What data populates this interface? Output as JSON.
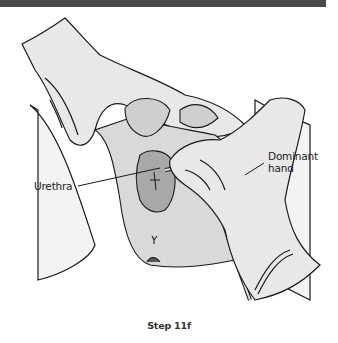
{
  "figure": {
    "header_bar_color": "#4a4a4a",
    "labels": {
      "urethra": "Urethra",
      "dominant_hand_line1": "Dominant",
      "dominant_hand_line2": "hand"
    },
    "caption": "Step 11f",
    "colors": {
      "line": "#1a1a1a",
      "glove_fill": "#e6e6e6",
      "tissue_fill": "#bdbdbd",
      "sheet_fill": "#f2f2f2"
    }
  }
}
